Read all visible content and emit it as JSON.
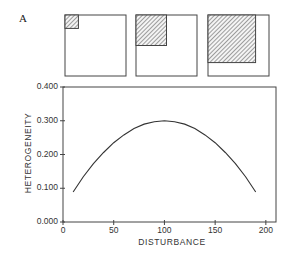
{
  "panel_label": "A",
  "chart_data": {
    "type": "line",
    "title": "",
    "xlabel": "DISTURBANCE",
    "ylabel": "HETEROGENEITY",
    "xlim": [
      0,
      210
    ],
    "ylim": [
      0.0,
      0.4
    ],
    "x_ticks": [
      "0",
      "50",
      "100",
      "150",
      "200"
    ],
    "y_ticks": [
      "0.000",
      "0.100",
      "0.200",
      "0.300",
      "0.400"
    ],
    "grid": false,
    "legend": null,
    "series": [
      {
        "name": "heterogeneity",
        "x": [
          10,
          20,
          30,
          40,
          50,
          60,
          70,
          80,
          90,
          100,
          110,
          120,
          130,
          140,
          150,
          160,
          170,
          180,
          190
        ],
        "y": [
          0.089,
          0.134,
          0.173,
          0.206,
          0.235,
          0.258,
          0.277,
          0.29,
          0.297,
          0.3,
          0.297,
          0.29,
          0.277,
          0.258,
          0.235,
          0.206,
          0.173,
          0.134,
          0.089
        ]
      }
    ],
    "inset_diagrams": [
      {
        "name": "low-disturbance",
        "hatched_fraction": 0.22,
        "description": "small hatched square in top-left corner of empty square"
      },
      {
        "name": "medium-disturbance",
        "hatched_fraction": 0.5,
        "description": "medium hatched square in top-left corner"
      },
      {
        "name": "high-disturbance",
        "hatched_fraction": 0.78,
        "description": "large hatched square in top-left corner"
      }
    ]
  }
}
